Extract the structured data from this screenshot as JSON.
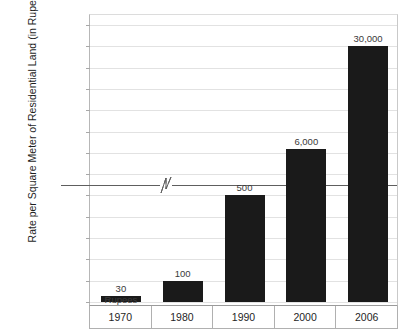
{
  "chart_data": {
    "type": "bar",
    "title": "",
    "xlabel": "",
    "ylabel": "Rate per Square Meter of Residential Land (in Rupees)",
    "categories": [
      "1970",
      "1980",
      "1990",
      "2000",
      "2006"
    ],
    "values": [
      30,
      100,
      500,
      6000,
      30000
    ],
    "value_labels": [
      "30",
      "100",
      "500",
      "6,000",
      "30,000"
    ],
    "annotations": [
      {
        "category": "1970",
        "text": "Rupees"
      }
    ],
    "y_ticks": [
      "35,000",
      "30,000",
      "25,000",
      "20,000",
      "15,000",
      "10,000",
      "5,000",
      "1,000",
      "500",
      "400",
      "300",
      "200",
      "100",
      "0"
    ],
    "y_tick_values": [
      35000,
      30000,
      25000,
      20000,
      15000,
      10000,
      5000,
      1000,
      500,
      400,
      300,
      200,
      100,
      0
    ],
    "axis_break": {
      "below": 1000,
      "above": 500,
      "marker": "zigzag"
    },
    "ylim": [
      0,
      35000
    ],
    "grid": true,
    "legend": "none",
    "bar_color": "#1a1a1a",
    "grid_color": "#e2e2e2",
    "background_color": "#ffffff"
  }
}
